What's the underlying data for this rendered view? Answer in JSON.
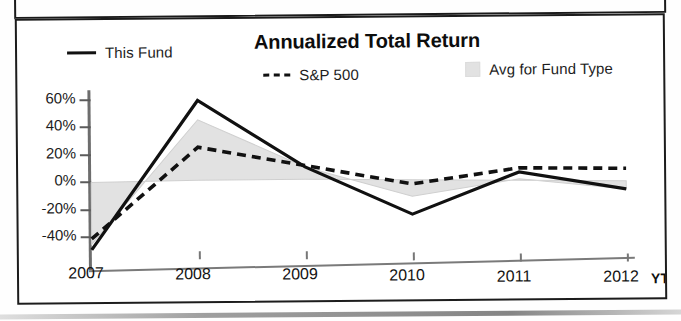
{
  "chart_data": {
    "type": "line",
    "title": "Annualized Total Return",
    "xlabel": "",
    "ylabel": "",
    "x": [
      "2007",
      "2008",
      "2009",
      "2010",
      "2011",
      "2012"
    ],
    "x_tick_labels": [
      "2007",
      "2008",
      "2009",
      "2010",
      "2011",
      "2012"
    ],
    "x_axis_suffix": "YTD",
    "y_tick_labels": [
      "60%",
      "40%",
      "20%",
      "0%",
      "-20%",
      "-40%"
    ],
    "y_tick_values": [
      60,
      40,
      20,
      0,
      -20,
      -40
    ],
    "ylim": [
      -55,
      65
    ],
    "grid": false,
    "legend_position": "top",
    "series": [
      {
        "name": "This Fund",
        "style": "solid",
        "color": "#111111",
        "values": [
          -50,
          58,
          9,
          -26,
          4,
          -9
        ]
      },
      {
        "name": "S&P 500",
        "style": "dashed",
        "color": "#111111",
        "values": [
          -42,
          24,
          10,
          -4,
          7,
          6
        ]
      },
      {
        "name": "Avg for Fund Type",
        "style": "area",
        "color": "#e2e2e2",
        "values": [
          -46,
          44,
          9,
          -13,
          -1,
          -9
        ],
        "baseline_values": [
          -1,
          0,
          0,
          -1,
          -2,
          -3
        ]
      }
    ]
  },
  "legend": {
    "items": [
      {
        "label": "This Fund",
        "swatch": "solid-line-swatch"
      },
      {
        "label": "S&P 500",
        "swatch": "dashed-line-swatch"
      },
      {
        "label": "Avg for Fund Type",
        "swatch": "gray-square-swatch"
      }
    ]
  }
}
